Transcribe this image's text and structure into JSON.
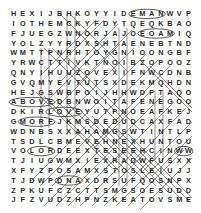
{
  "puzzle": {
    "type": "word-search-grid",
    "rows": 20,
    "cols": 20,
    "ink_color": "#2b2b2b",
    "mark_color": "#4a4a4a",
    "background_color": "#ffffff",
    "grid": [
      [
        "H",
        "E",
        "X",
        "I",
        "J",
        "B",
        "H",
        "K",
        "O",
        "Y",
        "Y",
        "I",
        "D",
        "E",
        "M",
        "A",
        "N",
        "W",
        "V",
        "P"
      ],
      [
        "I",
        "O",
        "T",
        "H",
        "E",
        "M",
        "C",
        "K",
        "Y",
        "F",
        "D",
        "Y",
        "T",
        "Q",
        "E",
        "Q",
        "K",
        "B",
        "A",
        "O"
      ],
      [
        "F",
        "J",
        "U",
        "E",
        "G",
        "Z",
        "W",
        "N",
        "O",
        "R",
        "J",
        "A",
        "J",
        "O",
        "E",
        "O",
        "A",
        "M",
        "I",
        "Q"
      ],
      [
        "Y",
        "O",
        "L",
        "Z",
        "Y",
        "Y",
        "R",
        "D",
        "X",
        "S",
        "H",
        "T",
        "A",
        "E",
        "N",
        "E",
        "B",
        "T",
        "N",
        "D"
      ],
      [
        "W",
        "M",
        "T",
        "T",
        "P",
        "N",
        "R",
        "H",
        "T",
        "O",
        "Y",
        "G",
        "N",
        "I",
        "O",
        "O",
        "N",
        "G",
        "B",
        "F"
      ],
      [
        "Y",
        "R",
        "W",
        "C",
        "T",
        "T",
        "I",
        "V",
        "K",
        "T",
        "N",
        "O",
        "I",
        "B",
        "Z",
        "O",
        "P",
        "O",
        "O",
        "Z"
      ],
      [
        "Q",
        "N",
        "Y",
        "I",
        "H",
        "U",
        "U",
        "Z",
        "O",
        "V",
        "E",
        "X",
        "I",
        "F",
        "N",
        "W",
        "C",
        "D",
        "N",
        "B"
      ],
      [
        "G",
        "V",
        "Q",
        "M",
        "Y",
        "E",
        "V",
        "T",
        "U",
        "T",
        "S",
        "X",
        "D",
        "E",
        "K",
        "M",
        "Q",
        "H",
        "D",
        "N"
      ],
      [
        "H",
        "E",
        "J",
        "G",
        "S",
        "W",
        "B",
        "P",
        "O",
        "I",
        "J",
        "H",
        "H",
        "W",
        "D",
        "P",
        "T",
        "A",
        "Q",
        "O"
      ],
      [
        "A",
        "B",
        "O",
        "V",
        "E",
        "D",
        "B",
        "N",
        "W",
        "O",
        "I",
        "T",
        "A",
        "F",
        "E",
        "N",
        "E",
        "G",
        "O",
        "O"
      ],
      [
        "D",
        "K",
        "I",
        "R",
        "L",
        "O",
        "V",
        "E",
        "Y",
        "U",
        "T",
        "P",
        "N",
        "O",
        "E",
        "A",
        "F",
        "K",
        "E",
        "J"
      ],
      [
        "G",
        "M",
        "O",
        "R",
        "F",
        "J",
        "K",
        "M",
        "S",
        "D",
        "E",
        "D",
        "U",
        "D",
        "C",
        "A",
        "X",
        "F",
        "A",
        "D"
      ],
      [
        "W",
        "D",
        "N",
        "B",
        "S",
        "X",
        "X",
        "A",
        "H",
        "A",
        "M",
        "G",
        "S",
        "W",
        "T",
        "I",
        "N",
        "T",
        "L",
        "P"
      ],
      [
        "T",
        "S",
        "D",
        "L",
        "C",
        "B",
        "M",
        "E",
        "V",
        "E",
        "H",
        "N",
        "E",
        "X",
        "H",
        "U",
        "N",
        "T",
        "O",
        "U"
      ],
      [
        "V",
        "O",
        "L",
        "O",
        "R",
        "D",
        "E",
        "E",
        "X",
        "T",
        "E",
        "S",
        "E",
        "E",
        "H",
        "C",
        "I",
        "N",
        "W",
        "W"
      ],
      [
        "T",
        "J",
        "I",
        "U",
        "G",
        "W",
        "M",
        "X",
        "I",
        "E",
        "X",
        "R",
        "A",
        "D",
        "W",
        "F",
        "U",
        "S",
        "X",
        "X"
      ],
      [
        "X",
        "F",
        "Y",
        "Z",
        "P",
        "O",
        "S",
        "A",
        "M",
        "X",
        "S",
        "T",
        "O",
        "S",
        "L",
        "E",
        "I",
        "U",
        "J",
        "J"
      ],
      [
        "T",
        "J",
        "D",
        "W",
        "P",
        "D",
        "N",
        "A",
        "X",
        "D",
        "R",
        "S",
        "U",
        "F",
        "Q",
        "O",
        "S",
        "N",
        "P",
        "X"
      ],
      [
        "Z",
        "P",
        "K",
        "U",
        "F",
        "C",
        "Z",
        "C",
        "T",
        "T",
        "S",
        "M",
        "G",
        "S",
        "O",
        "E",
        "S",
        "U",
        "D",
        "D"
      ],
      [
        "J",
        "F",
        "Z",
        "V",
        "U",
        "D",
        "Z",
        "H",
        "P",
        "N",
        "Z",
        "K",
        "E",
        "A",
        "T",
        "O",
        "V",
        "S",
        "M",
        "E"
      ]
    ],
    "found_words": [
      {
        "text": "ABOVE",
        "row": 9,
        "col_start": 0,
        "col_end": 4,
        "shape": "ellipse"
      },
      {
        "text": "LOVE",
        "row": 10,
        "col_start": 4,
        "col_end": 7,
        "shape": "ellipse"
      },
      {
        "text": "MORF",
        "row": 11,
        "col_start": 1,
        "col_end": 4,
        "shape": "ellipse"
      },
      {
        "text": "LOR",
        "row": 14,
        "col_start": 2,
        "col_end": 4,
        "shape": "ellipse"
      },
      {
        "text": "EMAN",
        "row": 0,
        "col_start": 13,
        "col_end": 16,
        "shape": "ellipse"
      },
      {
        "text": "EOAM",
        "row": 2,
        "col_start": 14,
        "col_end": 17,
        "shape": "ellipse"
      },
      {
        "text": "NW",
        "row": 14,
        "col_start": 18,
        "col_end": 19,
        "shape": "ellipse"
      },
      {
        "text": "DNA",
        "row": 17,
        "col_start": 5,
        "col_end": 7,
        "shape": "ellipse"
      }
    ]
  }
}
